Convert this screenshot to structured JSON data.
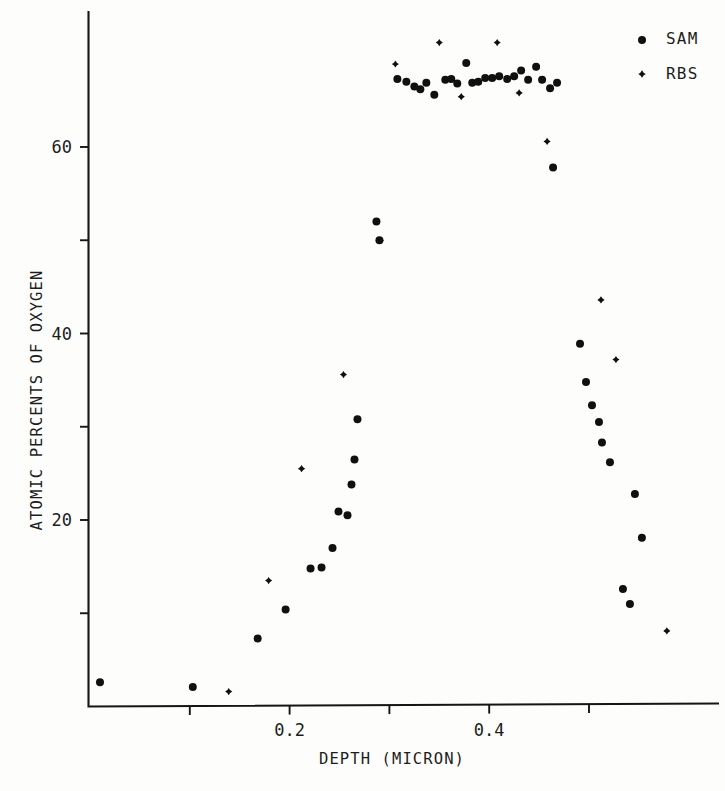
{
  "chart_data": {
    "type": "scatter",
    "title": "",
    "xlabel": "DEPTH (MICRON)",
    "ylabel": "ATOMIC PERCENTS OF OXYGEN",
    "xlim": [
      0.0,
      0.59
    ],
    "ylim": [
      0,
      74
    ],
    "grid": false,
    "legend_position": "top-right",
    "x_ticks_major": [
      0.2,
      0.4
    ],
    "x_tick_labels": [
      "0.2",
      "0.4"
    ],
    "x_ticks_minor": [
      0.1,
      0.3,
      0.5
    ],
    "y_ticks_major": [
      20,
      40,
      60
    ],
    "y_tick_labels": [
      "20",
      "40",
      "60"
    ],
    "y_ticks_minor": [
      10,
      30,
      50
    ],
    "series": [
      {
        "name": "SAM",
        "marker": "dot",
        "color": "#101010",
        "points": [
          [
            0.01,
            2.6
          ],
          [
            0.103,
            2.1
          ],
          [
            0.168,
            7.3
          ],
          [
            0.196,
            10.4
          ],
          [
            0.221,
            14.8
          ],
          [
            0.232,
            14.9
          ],
          [
            0.243,
            17.0
          ],
          [
            0.249,
            20.9
          ],
          [
            0.258,
            20.5
          ],
          [
            0.262,
            23.8
          ],
          [
            0.265,
            26.5
          ],
          [
            0.268,
            30.8
          ],
          [
            0.287,
            52.0
          ],
          [
            0.29,
            50.0
          ],
          [
            0.308,
            67.3
          ],
          [
            0.317,
            67.0
          ],
          [
            0.325,
            66.5
          ],
          [
            0.331,
            66.2
          ],
          [
            0.337,
            66.9
          ],
          [
            0.345,
            65.6
          ],
          [
            0.356,
            67.2
          ],
          [
            0.362,
            67.3
          ],
          [
            0.368,
            66.8
          ],
          [
            0.377,
            69.0
          ],
          [
            0.383,
            66.9
          ],
          [
            0.389,
            67.0
          ],
          [
            0.396,
            67.4
          ],
          [
            0.403,
            67.4
          ],
          [
            0.41,
            67.6
          ],
          [
            0.418,
            67.3
          ],
          [
            0.425,
            67.6
          ],
          [
            0.432,
            68.2
          ],
          [
            0.439,
            67.2
          ],
          [
            0.447,
            68.6
          ],
          [
            0.453,
            67.2
          ],
          [
            0.461,
            66.3
          ],
          [
            0.468,
            66.9
          ],
          [
            0.464,
            57.8
          ],
          [
            0.491,
            38.9
          ],
          [
            0.497,
            34.8
          ],
          [
            0.503,
            32.3
          ],
          [
            0.51,
            30.5
          ],
          [
            0.513,
            28.3
          ],
          [
            0.521,
            26.2
          ],
          [
            0.546,
            22.8
          ],
          [
            0.553,
            18.1
          ],
          [
            0.534,
            12.6
          ],
          [
            0.541,
            11.0
          ]
        ]
      },
      {
        "name": "RBS",
        "marker": "cross",
        "color": "#101010",
        "points": [
          [
            0.139,
            1.6
          ],
          [
            0.179,
            13.5
          ],
          [
            0.212,
            25.5
          ],
          [
            0.254,
            35.6
          ],
          [
            0.291,
            50.0
          ],
          [
            0.306,
            68.9
          ],
          [
            0.35,
            71.2
          ],
          [
            0.408,
            71.2
          ],
          [
            0.372,
            65.4
          ],
          [
            0.43,
            65.8
          ],
          [
            0.458,
            60.6
          ],
          [
            0.512,
            43.6
          ],
          [
            0.527,
            37.2
          ],
          [
            0.578,
            8.1
          ]
        ]
      }
    ]
  },
  "legend": {
    "entries": [
      {
        "label": "SAM",
        "marker": "dot"
      },
      {
        "label": "RBS",
        "marker": "cross"
      }
    ]
  }
}
